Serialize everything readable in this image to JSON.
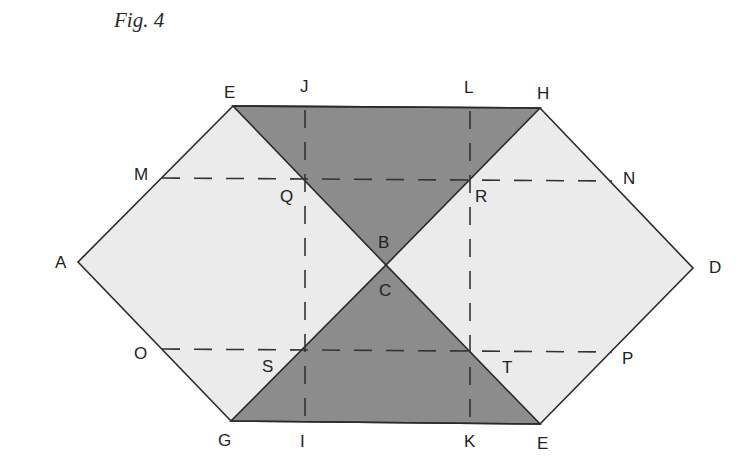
{
  "figure": {
    "title": "Fig. 4",
    "colors": {
      "light_fill": "#ebebeb",
      "dark_fill": "#8c8c8c",
      "outline": "#2a2a2a",
      "dash": "#333333",
      "background": "#ffffff"
    },
    "points": {
      "E_top": {
        "label": "E",
        "x": 233,
        "y": 106
      },
      "H": {
        "label": "H",
        "x": 540,
        "y": 108
      },
      "A": {
        "label": "A",
        "x": 78,
        "y": 262
      },
      "D": {
        "label": "D",
        "x": 693,
        "y": 268
      },
      "G": {
        "label": "G",
        "x": 231,
        "y": 421
      },
      "E_bottom": {
        "label": "E",
        "x": 540,
        "y": 424
      },
      "center": {
        "x": 386,
        "y": 265
      },
      "J": {
        "label": "J",
        "x": 305,
        "y": 107
      },
      "L": {
        "label": "L",
        "x": 470,
        "y": 108
      },
      "M": {
        "label": "M",
        "x": 162,
        "y": 178
      },
      "N": {
        "label": "N",
        "x": 612,
        "y": 181
      },
      "Q": {
        "label": "Q",
        "x": 305,
        "y": 178
      },
      "R": {
        "label": "R",
        "x": 470,
        "y": 180
      },
      "O": {
        "label": "O",
        "x": 162,
        "y": 349
      },
      "P": {
        "label": "P",
        "x": 612,
        "y": 352
      },
      "S": {
        "label": "S",
        "x": 305,
        "y": 349
      },
      "T": {
        "label": "T",
        "x": 470,
        "y": 351
      },
      "I": {
        "label": "I",
        "x": 305,
        "y": 422
      },
      "K": {
        "label": "K",
        "x": 470,
        "y": 423
      },
      "B": {
        "label": "B"
      },
      "C": {
        "label": "C"
      }
    }
  }
}
